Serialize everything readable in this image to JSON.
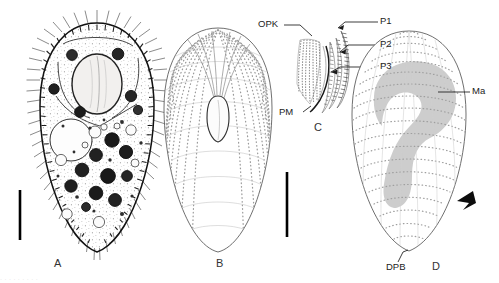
{
  "figure": {
    "type": "scientific-line-drawing",
    "background_color": "#ffffff",
    "ink_color": "#1a1a1a",
    "shading_color": "#b9b9b9",
    "panels": [
      {
        "id": "A",
        "letter": "A",
        "description": "Ventral view of live specimen showing cilia, macronucleus, contractile vacuole and food vacuoles",
        "scale_bar": true
      },
      {
        "id": "B",
        "letter": "B",
        "description": "Silverline / infraciliature pattern of ventral side with somatic kineties",
        "scale_bar": true
      },
      {
        "id": "C",
        "letter": "C",
        "description": "Detail of oral apparatus",
        "scale_bar": false
      },
      {
        "id": "D",
        "letter": "D",
        "description": "Dorsal infraciliature with macronucleus and dorsal posterior end",
        "scale_bar": false
      }
    ],
    "labels": [
      {
        "key": "OPK",
        "text": "OPK",
        "meaning": "oral-polykinetid",
        "panel": "C"
      },
      {
        "key": "PM",
        "text": "PM",
        "meaning": "paroral-membrane",
        "panel": "C"
      },
      {
        "key": "P1",
        "text": "P1",
        "meaning": "peniculus-1",
        "panel": "C"
      },
      {
        "key": "P2",
        "text": "P2",
        "meaning": "peniculus-2",
        "panel": "C"
      },
      {
        "key": "P3",
        "text": "P3",
        "meaning": "peniculus-3",
        "panel": "C"
      },
      {
        "key": "Ma",
        "text": "Ma",
        "meaning": "macronucleus",
        "panel": "D"
      },
      {
        "key": "DPB",
        "text": "DPB",
        "meaning": "dorsal-posterior-basal-bodies",
        "panel": "D"
      }
    ],
    "annotations": [
      {
        "name": "arrowhead-marker",
        "panel": "D",
        "description": "black arrowhead indicating lateral feature"
      }
    ],
    "caption_fragment": "· · ·  · ·   ·  · · ·"
  }
}
